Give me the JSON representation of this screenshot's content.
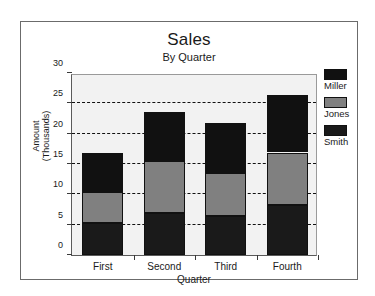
{
  "chart_data": {
    "type": "bar",
    "subtype": "stacked-column",
    "title": "Sales",
    "subtitle": "By Quarter",
    "xlabel": "Quarter",
    "ylabel_line1": "Amount",
    "ylabel_line2": "(Thousands)",
    "categories": [
      "First",
      "Second",
      "Third",
      "Fourth"
    ],
    "series": [
      {
        "name": "Smith",
        "color": "#1a1a1a",
        "values": [
          5.2,
          7.0,
          6.5,
          8.2
        ]
      },
      {
        "name": "Jones",
        "color": "#808080",
        "values": [
          5.2,
          8.5,
          7.0,
          8.7
        ]
      },
      {
        "name": "Miller",
        "color": "#111111",
        "values": [
          6.4,
          8.0,
          8.2,
          9.4
        ]
      }
    ],
    "totals": [
      16.8,
      23.5,
      21.7,
      26.3
    ],
    "ylim": [
      0,
      30
    ],
    "yticks": [
      0,
      5,
      10,
      15,
      20,
      25,
      30
    ],
    "ytick_labels": [
      "0",
      "5",
      "10",
      "15",
      "20",
      "25",
      "30"
    ],
    "grid": "horizontal-dashed",
    "legend_position": "right",
    "legend_order": [
      "Miller",
      "Jones",
      "Smith"
    ],
    "plot_background": "#f2f2f2",
    "frame_color": "#6b6b6b"
  }
}
